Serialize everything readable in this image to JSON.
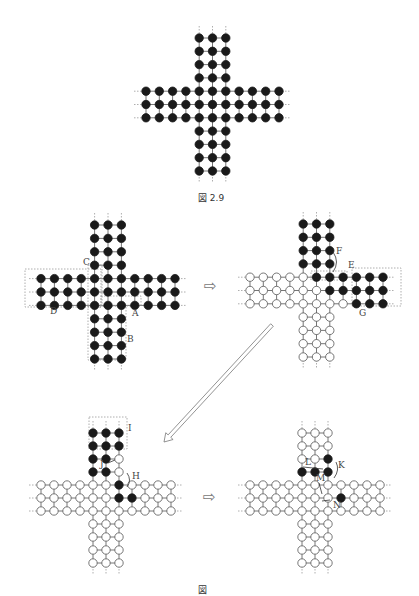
{
  "figure_caption": "図 2.9",
  "next_caption": "図",
  "colors": {
    "peg": "#1a1a1a",
    "hole_stroke": "#555555",
    "line": "#666666",
    "dotted": "#999999",
    "arrow": "#777777"
  },
  "board_layout": {
    "description": "Cross-shaped peg solitaire board: 3-wide arms of length 4, 3x3 center",
    "arm_length": 4,
    "width": 3
  },
  "diagrams": [
    {
      "id": "initial",
      "name": "initial-board",
      "origin": [
        146,
        38
      ],
      "step": 13.3,
      "empty": [
        "C1"
      ],
      "filled_all_except_empty": true,
      "labels": [],
      "boxes": []
    },
    {
      "id": "step1",
      "name": "step-1-board",
      "origin": [
        41,
        225
      ],
      "step": 13.4,
      "empty": [
        "C1"
      ],
      "filled_all_except_empty": true,
      "labels": [
        {
          "text": "C",
          "x": 83,
          "y": 265
        },
        {
          "text": "D",
          "x": 50,
          "y": 314
        },
        {
          "text": "A",
          "x": 132,
          "y": 316
        },
        {
          "text": "B",
          "x": 127,
          "y": 342
        }
      ],
      "boxes": [
        {
          "name": "box-D",
          "x": 25,
          "y": 269,
          "w": 76,
          "h": 38
        },
        {
          "name": "box-C",
          "x": 88,
          "y": 265,
          "w": 14,
          "h": 42
        },
        {
          "name": "box-A",
          "x": 101,
          "y": 296,
          "w": 40,
          "h": 10
        },
        {
          "name": "box-B",
          "x": 88,
          "y": 306,
          "w": 38,
          "h": 54
        }
      ]
    },
    {
      "id": "step2",
      "name": "step-2-board",
      "origin": [
        250,
        224
      ],
      "step": 13.3,
      "filled": [
        "T0_0",
        "T0_1",
        "T0_2",
        "T1_0",
        "T1_1",
        "T1_2",
        "T2_0",
        "T2_1",
        "T2_2",
        "T3_0",
        "T3_1",
        "T3_2",
        "C0_1",
        "C0_2",
        "C1_2",
        "R0_0",
        "R0_1",
        "R0_2",
        "R0_3",
        "R1_0",
        "R1_1",
        "R1_2",
        "R1_3",
        "R2_1",
        "R2_2",
        "R2_3"
      ],
      "labels": [
        {
          "text": "F",
          "x": 336,
          "y": 254
        },
        {
          "text": "E",
          "x": 348,
          "y": 268
        },
        {
          "text": "G",
          "x": 359,
          "y": 316
        }
      ],
      "boxes": [
        {
          "name": "box-E",
          "x": 311,
          "y": 271,
          "w": 36,
          "h": 9
        },
        {
          "name": "box-G",
          "x": 352,
          "y": 268,
          "w": 49,
          "h": 38
        }
      ]
    },
    {
      "id": "step3",
      "name": "step-3-board",
      "origin": [
        41,
        433
      ],
      "step": 13.0,
      "filled": [
        "T0_0",
        "T0_1",
        "T0_2",
        "T1_0",
        "T1_1",
        "T1_2",
        "T2_0",
        "T2_1",
        "T3_0",
        "T3_1",
        "C0_2",
        "C1_2",
        "R1_0"
      ],
      "labels": [
        {
          "text": "I",
          "x": 128,
          "y": 431
        },
        {
          "text": "J",
          "x": 100,
          "y": 467
        },
        {
          "text": "H",
          "x": 132,
          "y": 479
        }
      ],
      "boxes": [
        {
          "name": "box-I",
          "x": 89,
          "y": 417,
          "w": 38,
          "h": 32
        }
      ]
    },
    {
      "id": "step4",
      "name": "step-4-board",
      "origin": [
        250,
        433
      ],
      "step": 13.0,
      "filled": [
        "T2_2",
        "T3_0",
        "T3_1",
        "T3_2",
        "R1_0"
      ],
      "labels": [
        {
          "text": "K",
          "x": 338,
          "y": 468
        },
        {
          "text": "L",
          "x": 305,
          "y": 465
        },
        {
          "text": "M",
          "x": 316,
          "y": 481
        },
        {
          "text": "N",
          "x": 333,
          "y": 508
        }
      ],
      "boxes": []
    }
  ],
  "arrows": [
    {
      "name": "right-arrow-1",
      "glyph": "⇨",
      "x": 204,
      "y": 291
    },
    {
      "name": "right-arrow-2",
      "glyph": "⇨",
      "x": 203,
      "y": 502
    }
  ],
  "diagonal_arrow": {
    "x1": 272,
    "y1": 325,
    "x2": 164,
    "y2": 442
  }
}
